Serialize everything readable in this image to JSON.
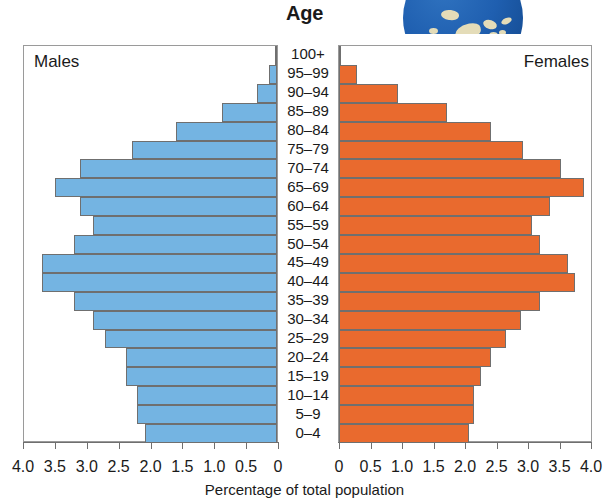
{
  "chart_title": "Age",
  "axis_caption": "Percentage of total population",
  "panels": {
    "left_label": "Males",
    "right_label": "Females"
  },
  "colors": {
    "males": "#74b4e2",
    "females": "#e96a2e",
    "bar_outline": "#6f6f6f",
    "frame": "#9a9a9a",
    "globe_ocean": "#1f5fb0",
    "globe_land": "#e4dcb8"
  },
  "icons": {
    "globe": "globe-icon"
  },
  "axis": {
    "left_ticklabels": [
      "4.0",
      "3.5",
      "3.0",
      "2.5",
      "2.0",
      "1.5",
      "1.0",
      "0.5",
      "0"
    ],
    "right_ticklabels": [
      "0",
      "0.5",
      "1.0",
      "1.5",
      "2.0",
      "2.5",
      "3.0",
      "3.5",
      "4.0"
    ],
    "min": 0,
    "max": 4.0,
    "step": 0.5
  },
  "chart_data": {
    "type": "bar",
    "subtype": "population-pyramid",
    "title": "Age",
    "xlabel": "Percentage of total population",
    "ylabel": "Age",
    "xlim": [
      0,
      4.0
    ],
    "xticks": [
      0,
      0.5,
      1.0,
      1.5,
      2.0,
      2.5,
      3.0,
      3.5,
      4.0
    ],
    "grid": false,
    "legend": [
      "Males",
      "Females"
    ],
    "legend_position": "inside-top-corners",
    "categories": [
      "100+",
      "95–99",
      "90–94",
      "85–89",
      "80–84",
      "75–79",
      "70–74",
      "65–69",
      "60–64",
      "55–59",
      "50–54",
      "45–49",
      "40–44",
      "35–39",
      "30–34",
      "25–29",
      "20–24",
      "15–19",
      "10–14",
      "5–9",
      "0–4"
    ],
    "series": [
      {
        "name": "Males",
        "color": "#74b4e2",
        "side": "left",
        "values": [
          0.02,
          0.12,
          0.32,
          0.87,
          1.59,
          2.28,
          3.09,
          3.49,
          3.09,
          2.89,
          3.18,
          3.68,
          3.68,
          3.18,
          2.89,
          2.7,
          2.37,
          2.37,
          2.19,
          2.19,
          2.07
        ]
      },
      {
        "name": "Females",
        "color": "#e96a2e",
        "side": "right",
        "values": [
          0.03,
          0.29,
          0.93,
          1.7,
          2.39,
          2.89,
          3.5,
          3.86,
          3.32,
          3.04,
          3.17,
          3.6,
          3.72,
          3.17,
          2.87,
          2.63,
          2.4,
          2.24,
          2.12,
          2.12,
          2.05
        ]
      }
    ]
  }
}
